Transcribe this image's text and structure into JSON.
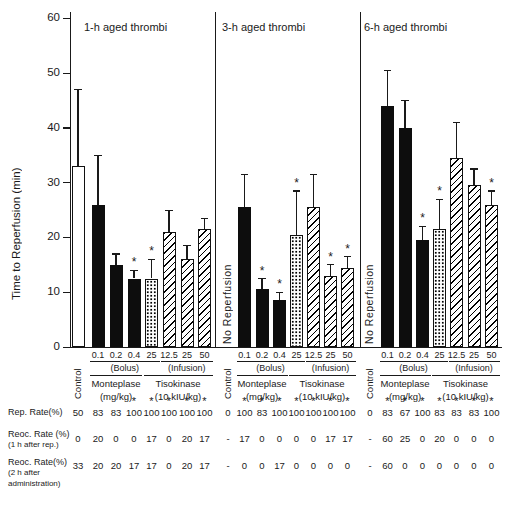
{
  "chart_data": {
    "type": "bar",
    "ylabel": "Time to Reperfusion (min)",
    "ylim": [
      0,
      60
    ],
    "yticks": [
      0,
      10,
      20,
      30,
      40,
      50,
      60
    ],
    "grid": false,
    "no_reperfusion_label": "No Reperfusion",
    "axis_labels": {
      "control": "Control",
      "dose_labels": [
        "0.1",
        "0.2",
        "0.4",
        "25",
        "12.5",
        "25",
        "50"
      ],
      "bolus": "(Bolus)",
      "infusion": "(Infusion)",
      "monteplase": "Monteplase",
      "monteplase_unit": "(mg/kg)",
      "tisokinase": "Tisokinase",
      "tisokinase_unit": "(10 kIU/kg)"
    },
    "panels": [
      {
        "title": "1-h aged thrombi",
        "control": {
          "has_bar": true,
          "value": 33,
          "err_top": 47,
          "style": "open",
          "star": false
        },
        "bars": [
          {
            "dose": "0.1",
            "value": 26,
            "err_top": 35,
            "style": "solid",
            "star": false
          },
          {
            "dose": "0.2",
            "value": 15,
            "err_top": 17,
            "style": "solid",
            "star": false
          },
          {
            "dose": "0.4",
            "value": 12.5,
            "err_top": 14,
            "style": "solid",
            "star": true
          },
          {
            "dose": "25",
            "value": 12.5,
            "err_top": 16,
            "style": "dotted",
            "star": true
          },
          {
            "dose": "12.5",
            "value": 21,
            "err_top": 25,
            "style": "hatched",
            "star": false
          },
          {
            "dose": "25",
            "value": 16,
            "err_top": 18.5,
            "style": "hatched",
            "star": false
          },
          {
            "dose": "50",
            "value": 21.5,
            "err_top": 23.5,
            "style": "hatched",
            "star": false
          }
        ],
        "rep_rate": [
          "50",
          "83",
          "83",
          "100",
          "100",
          "100",
          "100",
          "100"
        ],
        "rep_rate_stars": [
          false,
          false,
          false,
          true,
          true,
          true,
          true,
          true
        ],
        "reoc_rate_1h": [
          "0",
          "20",
          "0",
          "0",
          "17",
          "0",
          "20",
          "17"
        ],
        "reoc_rate_2h": [
          "33",
          "20",
          "20",
          "17",
          "17",
          "0",
          "20",
          "17"
        ]
      },
      {
        "title": "3-h aged thrombi",
        "control": {
          "has_bar": false,
          "label": "No Reperfusion"
        },
        "bars": [
          {
            "dose": "0.1",
            "value": 25.5,
            "err_top": 31.5,
            "style": "solid",
            "star": false
          },
          {
            "dose": "0.2",
            "value": 10.5,
            "err_top": 12.5,
            "style": "solid",
            "star": true
          },
          {
            "dose": "0.4",
            "value": 8.5,
            "err_top": 10,
            "style": "solid",
            "star": true
          },
          {
            "dose": "25",
            "value": 20.5,
            "err_top": 28.5,
            "style": "dotted",
            "star": true
          },
          {
            "dose": "12.5",
            "value": 25.5,
            "err_top": 31.5,
            "style": "hatched",
            "star": false
          },
          {
            "dose": "25",
            "value": 13,
            "err_top": 15,
            "style": "hatched",
            "star": true
          },
          {
            "dose": "50",
            "value": 14.5,
            "err_top": 16.5,
            "style": "hatched",
            "star": true
          }
        ],
        "rep_rate": [
          "0",
          "100",
          "83",
          "100",
          "100",
          "100",
          "100",
          "100"
        ],
        "rep_rate_stars": [
          false,
          true,
          true,
          true,
          true,
          true,
          true,
          true
        ],
        "reoc_rate_1h": [
          "-",
          "17",
          "0",
          "0",
          "0",
          "0",
          "17",
          "17"
        ],
        "reoc_rate_2h": [
          "-",
          "0",
          "0",
          "17",
          "0",
          "0",
          "0",
          "0"
        ]
      },
      {
        "title": "6-h aged thrombi",
        "control": {
          "has_bar": false,
          "label": "No Reperfusion"
        },
        "bars": [
          {
            "dose": "0.1",
            "value": 44,
            "err_top": 50.5,
            "style": "solid",
            "star": false
          },
          {
            "dose": "0.2",
            "value": 40,
            "err_top": 45,
            "style": "solid",
            "star": false
          },
          {
            "dose": "0.4",
            "value": 19.5,
            "err_top": 22,
            "style": "solid",
            "star": true
          },
          {
            "dose": "25",
            "value": 21.5,
            "err_top": 27,
            "style": "dotted",
            "star": true
          },
          {
            "dose": "12.5",
            "value": 34.5,
            "err_top": 41,
            "style": "hatched",
            "star": false
          },
          {
            "dose": "25",
            "value": 29.5,
            "err_top": 32.5,
            "style": "hatched",
            "star": false
          },
          {
            "dose": "50",
            "value": 26,
            "err_top": 28.5,
            "style": "hatched",
            "star": true
          }
        ],
        "rep_rate": [
          "0",
          "83",
          "67",
          "100",
          "83",
          "83",
          "83",
          "100"
        ],
        "rep_rate_stars": [
          false,
          true,
          true,
          true,
          true,
          true,
          true,
          true
        ],
        "reoc_rate_1h": [
          "-",
          "60",
          "25",
          "0",
          "20",
          "0",
          "0",
          "0"
        ],
        "reoc_rate_2h": [
          "-",
          "60",
          "0",
          "0",
          "0",
          "0",
          "0",
          "0"
        ]
      }
    ]
  },
  "table": {
    "rep_rate_label": "Rep. Rate(%)",
    "reoc1_label": "Reoc. Rate (%)",
    "reoc1_sub": "(1 h after rep.)",
    "reoc2_label": "Reoc. Rate(%)",
    "reoc2_sub1": "(2 h after",
    "reoc2_sub2": "administration)"
  }
}
